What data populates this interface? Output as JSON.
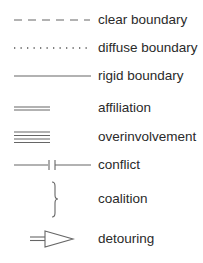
{
  "legend": {
    "items": [
      {
        "symbol": "dashed-line",
        "label": "clear boundary"
      },
      {
        "symbol": "dotted-line",
        "label": "diffuse boundary"
      },
      {
        "symbol": "solid-line",
        "label": "rigid boundary"
      },
      {
        "symbol": "double-line",
        "label": "affiliation"
      },
      {
        "symbol": "quadruple-line",
        "label": "overinvolvement"
      },
      {
        "symbol": "broken-line",
        "label": "conflict"
      },
      {
        "symbol": "brace",
        "label": "coalition"
      },
      {
        "symbol": "arrow-outline",
        "label": "detouring"
      }
    ]
  },
  "colors": {
    "line": "#555555",
    "text": "#2a2a2a",
    "background": "#ffffff"
  }
}
